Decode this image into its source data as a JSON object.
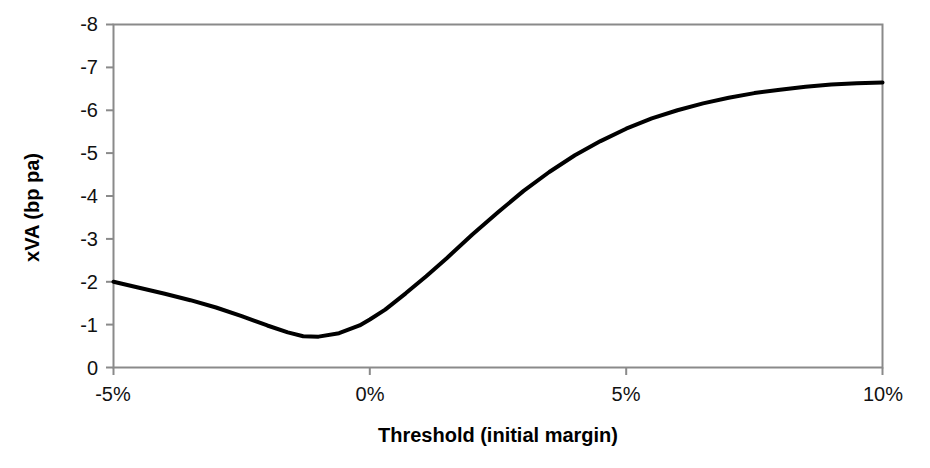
{
  "chart_data": {
    "type": "line",
    "title": "",
    "xlabel": "Threshold (initial margin)",
    "ylabel": "xVA (bp pa)",
    "xtick_labels": [
      "-5%",
      "0%",
      "5%",
      "10%"
    ],
    "xtick_values": [
      -5,
      0,
      5,
      10
    ],
    "ytick_labels": [
      "-8",
      "-7",
      "-6",
      "-5",
      "-4",
      "-3",
      "-2",
      "-1",
      "0"
    ],
    "ytick_values": [
      -8,
      -7,
      -6,
      -5,
      -4,
      -3,
      -2,
      -1,
      0
    ],
    "xlim": [
      -5,
      10
    ],
    "ylim": [
      0,
      -8
    ],
    "y_axis_inverted": true,
    "grid": false,
    "legend": false,
    "legend_position": "none",
    "series": [
      {
        "name": "xVA",
        "color": "#000000",
        "line_width": 4,
        "x": [
          -5.0,
          -4.5,
          -4.0,
          -3.5,
          -3.0,
          -2.5,
          -2.0,
          -1.6,
          -1.3,
          -1.0,
          -0.6,
          -0.2,
          0.0,
          0.3,
          0.7,
          1.1,
          1.5,
          2.0,
          2.5,
          3.0,
          3.5,
          4.0,
          4.5,
          5.0,
          5.5,
          6.0,
          6.5,
          7.0,
          7.5,
          8.0,
          8.5,
          9.0,
          9.5,
          10.0
        ],
        "y": [
          -2.0,
          -1.86,
          -1.72,
          -1.57,
          -1.4,
          -1.2,
          -0.98,
          -0.82,
          -0.73,
          -0.72,
          -0.8,
          -0.98,
          -1.12,
          -1.35,
          -1.73,
          -2.13,
          -2.55,
          -3.1,
          -3.62,
          -4.12,
          -4.56,
          -4.95,
          -5.28,
          -5.57,
          -5.81,
          -6.0,
          -6.16,
          -6.29,
          -6.4,
          -6.48,
          -6.55,
          -6.6,
          -6.63,
          -6.65
        ]
      }
    ],
    "annotations": [],
    "frame": {
      "left_spine": true,
      "bottom_spine": true,
      "top_spine": true,
      "right_spine": true,
      "color": "#808080"
    }
  },
  "axes": {
    "x_title": "Threshold (initial margin)",
    "y_title": "xVA (bp pa)",
    "y_labels": [
      "-8",
      "-7",
      "-6",
      "-5",
      "-4",
      "-3",
      "-2",
      "-1",
      "0"
    ],
    "x_labels": [
      "-5%",
      "0%",
      "5%",
      "10%"
    ]
  },
  "colors": {
    "background": "#ffffff",
    "curve": "#000000",
    "frame": "#8a8a8a",
    "text": "#111111"
  }
}
